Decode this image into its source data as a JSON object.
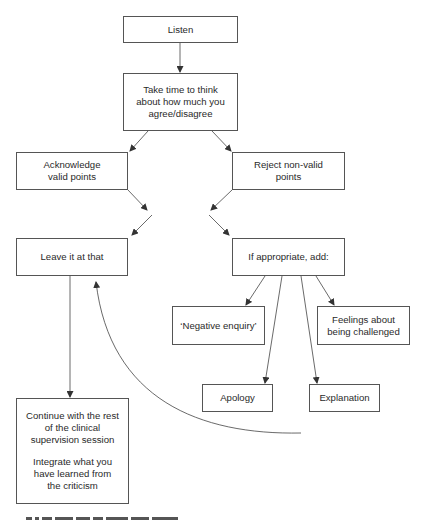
{
  "diagram": {
    "nodes": [
      {
        "id": "listen",
        "label": "Listen"
      },
      {
        "id": "think",
        "label": "Take time to think about how much you agree/disagree"
      },
      {
        "id": "acknowledge",
        "label": "Acknowledge valid points"
      },
      {
        "id": "reject",
        "label": "Reject non-valid points"
      },
      {
        "id": "leave",
        "label": "Leave it at that"
      },
      {
        "id": "appropriate",
        "label": "If appropriate, add:"
      },
      {
        "id": "negative_enquiry",
        "label": "‘Negative enquiry’"
      },
      {
        "id": "feelings",
        "label": "Feelings about being challenged"
      },
      {
        "id": "apology",
        "label": "Apology"
      },
      {
        "id": "explanation",
        "label": "Explanation"
      },
      {
        "id": "continue",
        "label": "Continue with the rest of the clinical supervision session",
        "label2": "Integrate what you have learned from the criticism"
      }
    ],
    "edges": [
      {
        "from": "listen",
        "to": "think"
      },
      {
        "from": "think",
        "to": "acknowledge"
      },
      {
        "from": "think",
        "to": "reject"
      },
      {
        "from": "acknowledge",
        "to": "appropriate",
        "crossing": true
      },
      {
        "from": "reject",
        "to": "leave",
        "crossing": true
      },
      {
        "from": "appropriate",
        "to": "negative_enquiry"
      },
      {
        "from": "appropriate",
        "to": "apology"
      },
      {
        "from": "appropriate",
        "to": "explanation"
      },
      {
        "from": "appropriate",
        "to": "feelings"
      },
      {
        "from": "leave",
        "to": "continue"
      },
      {
        "from": "appropriate_branch_return",
        "to": "leave",
        "curved": true
      }
    ],
    "caption_visible": "partially cropped, unreadable"
  }
}
